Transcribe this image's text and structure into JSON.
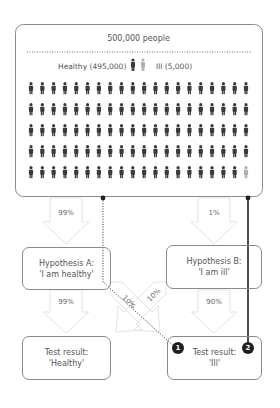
{
  "population": {
    "title": "500,000 people",
    "legend": {
      "healthy_label": "Healthy (495,000)",
      "ill_label": "Ill (5,000)"
    },
    "grid": {
      "rows": 5,
      "cols": 20,
      "healthy_count": 99,
      "ill_count": 1
    },
    "colors": {
      "healthy": "#3a3a3a",
      "ill": "#b0b0b0"
    }
  },
  "arrows": {
    "to_hypothesis_a": "99%",
    "to_hypothesis_b": "1%",
    "a_to_healthy": "99%",
    "a_to_ill": "10%",
    "b_to_healthy": "10%",
    "b_to_ill": "90%"
  },
  "hypothesis_a": {
    "line1": "Hypothesis A:",
    "line2": "'I am healthy'"
  },
  "hypothesis_b": {
    "line1": "Hypothesis B:",
    "line2": "'I am ill'"
  },
  "result_healthy": {
    "line1": "Test result:",
    "line2": "'Healthy'"
  },
  "result_ill": {
    "line1": "Test result:",
    "line2": "'Ill'"
  },
  "badges": {
    "one": "1",
    "two": "2"
  }
}
